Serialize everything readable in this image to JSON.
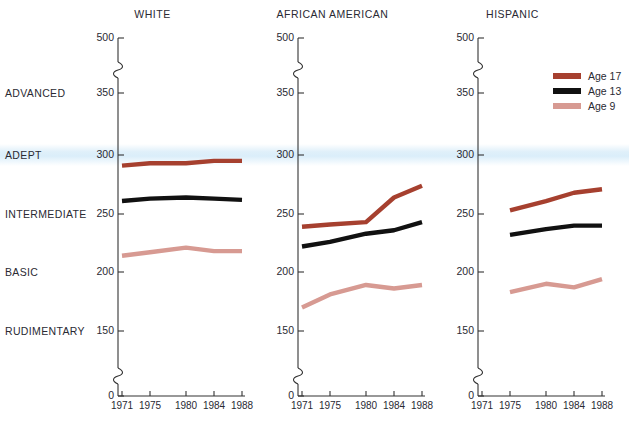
{
  "chart_data": {
    "type": "line",
    "title": "",
    "subtitle": "",
    "xlabel": "",
    "ylabel": "",
    "grid": false,
    "legend_position": "top-right",
    "x": [
      1971,
      1975,
      1980,
      1984,
      1988
    ],
    "xtick_labels": [
      "1971",
      "1975",
      "1980",
      "1984",
      "1988"
    ],
    "ytick_labels": [
      "500",
      "350",
      "300",
      "250",
      "200",
      "150",
      "0"
    ],
    "ytick_values": [
      500,
      350,
      300,
      250,
      200,
      150,
      0
    ],
    "axis_breaks": [
      [
        350,
        500
      ],
      [
        0,
        150
      ]
    ],
    "ylim": [
      0,
      500
    ],
    "level_bands": [
      {
        "label": "ADVANCED",
        "value": 350
      },
      {
        "label": "ADEPT",
        "value": 300
      },
      {
        "label": "INTERMEDIATE",
        "value": 250
      },
      {
        "label": "BASIC",
        "value": 200
      },
      {
        "label": "RUDIMENTARY",
        "value": 150
      }
    ],
    "highlight_band": {
      "label": "ADEPT",
      "value": 300,
      "color": "#cee8f8"
    },
    "panels": [
      {
        "name": "WHITE",
        "series": [
          {
            "name": "Age 17",
            "color": "#a6402f",
            "x": [
              1971,
              1975,
              1980,
              1984,
              1988
            ],
            "values": [
              291,
              293,
              293,
              295,
              295
            ]
          },
          {
            "name": "Age 13",
            "color": "#111111",
            "x": [
              1971,
              1975,
              1980,
              1984,
              1988
            ],
            "values": [
              261,
              263,
              264,
              263,
              262
            ]
          },
          {
            "name": "Age 9",
            "color": "#d79a92",
            "x": [
              1971,
              1975,
              1980,
              1984,
              1988
            ],
            "values": [
              214,
              217,
              221,
              218,
              218
            ]
          }
        ]
      },
      {
        "name": "AFRICAN AMERICAN",
        "series": [
          {
            "name": "Age 17",
            "color": "#a6402f",
            "x": [
              1971,
              1975,
              1980,
              1984,
              1988
            ],
            "values": [
              239,
              241,
              243,
              264,
              274
            ]
          },
          {
            "name": "Age 13",
            "color": "#111111",
            "x": [
              1971,
              1975,
              1980,
              1984,
              1988
            ],
            "values": [
              222,
              226,
              233,
              236,
              243
            ]
          },
          {
            "name": "Age 9",
            "color": "#d79a92",
            "x": [
              1971,
              1975,
              1980,
              1984,
              1988
            ],
            "values": [
              170,
              181,
              189,
              186,
              189
            ]
          }
        ]
      },
      {
        "name": "HISPANIC",
        "series": [
          {
            "name": "Age 17",
            "color": "#a6402f",
            "x": [
              1975,
              1980,
              1984,
              1988
            ],
            "values": [
              253,
              261,
              268,
              271
            ]
          },
          {
            "name": "Age 13",
            "color": "#111111",
            "x": [
              1975,
              1980,
              1984,
              1988
            ],
            "values": [
              232,
              237,
              240,
              240
            ]
          },
          {
            "name": "Age 9",
            "color": "#d79a92",
            "x": [
              1975,
              1980,
              1984,
              1988
            ],
            "values": [
              183,
              190,
              187,
              194
            ]
          }
        ]
      }
    ],
    "legend": [
      {
        "label": "Age 17",
        "color": "#a6402f"
      },
      {
        "label": "Age 13",
        "color": "#111111"
      },
      {
        "label": "Age 9",
        "color": "#d79a92"
      }
    ]
  }
}
